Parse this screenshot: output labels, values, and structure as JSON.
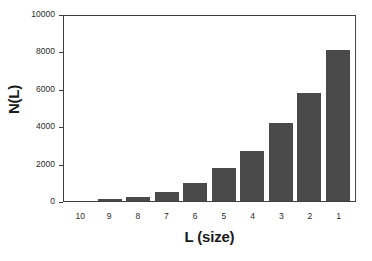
{
  "chart_data": {
    "type": "bar",
    "title": "",
    "xlabel": "L (size)",
    "ylabel": "N(L)",
    "categories": [
      "10",
      "9",
      "8",
      "7",
      "6",
      "5",
      "4",
      "3",
      "2",
      "1"
    ],
    "values": [
      0,
      100,
      220,
      490,
      970,
      1780,
      2700,
      4160,
      5780,
      8100
    ],
    "ylim": [
      0,
      10000
    ],
    "ytick_labels": [
      "0",
      "2000",
      "4000",
      "6000",
      "8000",
      "10000"
    ],
    "ytick_values": [
      0,
      2000,
      4000,
      6000,
      8000,
      10000
    ],
    "xtick_labels": [
      "10",
      "9",
      "8",
      "7",
      "6",
      "5",
      "4",
      "3",
      "2",
      "1"
    ],
    "grid": false,
    "legend": false,
    "bar_color": "#4a4a4a",
    "axis_color": "#3f3f3f",
    "background_color": "#ffffff"
  }
}
